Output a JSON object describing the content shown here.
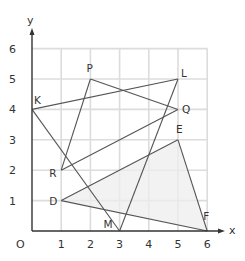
{
  "diagram": {
    "type": "coordinate-grid",
    "axes": {
      "x_label": "x",
      "y_label": "y",
      "origin_label": "O"
    },
    "x_ticks": [
      "1",
      "2",
      "3",
      "4",
      "5",
      "6"
    ],
    "y_ticks": [
      "1",
      "2",
      "3",
      "4",
      "5",
      "6"
    ],
    "grid_range": {
      "x": [
        0,
        6
      ],
      "y": [
        0,
        6
      ]
    },
    "points": [
      {
        "name": "K",
        "x": 0,
        "y": 4
      },
      {
        "name": "P",
        "x": 2,
        "y": 5
      },
      {
        "name": "L",
        "x": 5,
        "y": 5
      },
      {
        "name": "Q",
        "x": 5,
        "y": 4
      },
      {
        "name": "R",
        "x": 1,
        "y": 2
      },
      {
        "name": "E",
        "x": 5,
        "y": 3
      },
      {
        "name": "D",
        "x": 1,
        "y": 1
      },
      {
        "name": "M",
        "x": 3,
        "y": 0
      },
      {
        "name": "F",
        "x": 6,
        "y": 0
      }
    ],
    "segments": [
      [
        "K",
        "L"
      ],
      [
        "K",
        "M"
      ],
      [
        "L",
        "M"
      ],
      [
        "P",
        "R"
      ],
      [
        "P",
        "Q"
      ],
      [
        "R",
        "Q"
      ],
      [
        "D",
        "E"
      ],
      [
        "D",
        "F"
      ],
      [
        "E",
        "F"
      ]
    ],
    "shaded_triangle": [
      "D",
      "E",
      "F"
    ],
    "colors": {
      "grid": "#dcdcdc",
      "axis": "#333333",
      "line": "#555555",
      "shade": "#eeeeee"
    }
  }
}
